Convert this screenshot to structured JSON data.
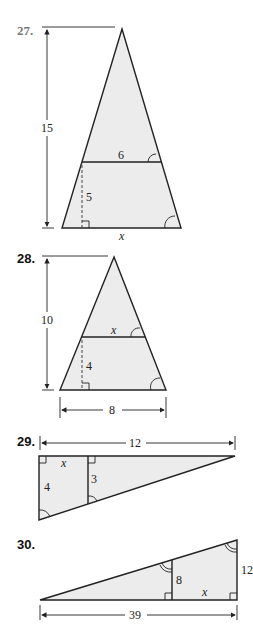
{
  "problems": [
    {
      "number": "27.",
      "height_label": "15",
      "top_segment_label": "6",
      "inner_height_label": "5",
      "base_label": "x"
    },
    {
      "number": "28.",
      "height_label": "10",
      "top_segment_label": "x",
      "inner_height_label": "4",
      "base_label": "8"
    },
    {
      "number": "29.",
      "width_label": "12",
      "segment_label": "x",
      "left_side_label": "4",
      "inner_side_label": "3"
    },
    {
      "number": "30.",
      "base_label": "39",
      "inner_side_label": "8",
      "segment_label": "x",
      "right_side_label": "12"
    }
  ],
  "colors": {
    "fill": "#ececec",
    "stroke": "#222222"
  }
}
